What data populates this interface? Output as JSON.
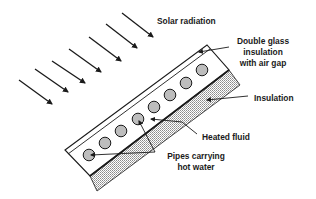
{
  "diagram": {
    "labels": {
      "solar_radiation": "Solar radiation",
      "glass_line1": "Double glass",
      "glass_line2": "insulation",
      "glass_line3": "with air gap",
      "insulation": "Insulation",
      "heated_fluid": "Heated fluid",
      "pipes_line1": "Pipes carrying",
      "pipes_line2": "hot water"
    },
    "colors": {
      "stroke": "#1a1a1a",
      "pipe_fill": "#bdbdbd",
      "insulation_hatch": "#8a8a8a",
      "background": "#ffffff"
    },
    "radiation_arrow_count": 7,
    "pipe_count": 8
  }
}
